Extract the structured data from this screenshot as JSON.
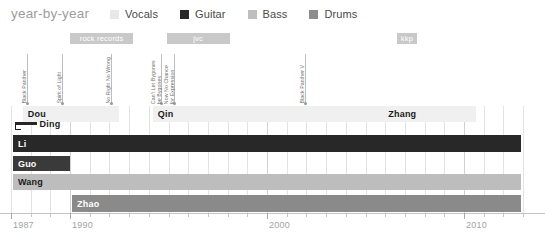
{
  "header": {
    "title": "year-by-year"
  },
  "legend": {
    "items": [
      {
        "label": "Vocals",
        "color": "#e8e8e8"
      },
      {
        "label": "Guitar",
        "color": "#262626"
      },
      {
        "label": "Bass",
        "color": "#bfbfbf"
      },
      {
        "label": "Drums",
        "color": "#8c8c8c"
      }
    ]
  },
  "chart_data": {
    "type": "bar",
    "title": "year-by-year",
    "xlabel": "",
    "ylabel": "",
    "xlim": [
      1987,
      2013.5
    ],
    "grid": true,
    "legend_position": "top",
    "axis": {
      "ticks": [
        1987,
        1990,
        2000,
        2010
      ],
      "tick_labels": [
        "1987",
        "1990",
        "2000",
        "2010"
      ],
      "minor_tick_step": 1
    },
    "categories": [
      "Vocals",
      "Guitar",
      "Bass",
      "Drums"
    ],
    "series": [
      {
        "name": "Vocals",
        "color": "#f0f0f0",
        "segments": [
          {
            "label": "Dou",
            "start": 1987.6,
            "end": 1992.5
          },
          {
            "label": "Qin",
            "start": 1994.2,
            "end": 2005.9
          },
          {
            "label": "Zhang",
            "start": 2005.9,
            "end": 2010.6
          }
        ]
      },
      {
        "name": "Vocals-sub",
        "color": "#262626",
        "segments": [
          {
            "label": "Ding",
            "start": 1987.2,
            "end": 1988.3
          }
        ]
      },
      {
        "name": "Guitar",
        "color": "#282828",
        "segments": [
          {
            "label": "Li",
            "start": 1987.1,
            "end": 2012.9
          }
        ]
      },
      {
        "name": "Guitar-sub",
        "color": "#3a3a3a",
        "segments": [
          {
            "label": "Guo",
            "start": 1987.1,
            "end": 1990.0
          }
        ]
      },
      {
        "name": "Bass",
        "color": "#bdbdbd",
        "segments": [
          {
            "label": "Wang",
            "start": 1987.1,
            "end": 2012.9
          }
        ]
      },
      {
        "name": "Drums",
        "color": "#8a8a8a",
        "segments": [
          {
            "label": "Zhao",
            "start": 1990.1,
            "end": 2012.9
          }
        ]
      }
    ],
    "label_bands": [
      {
        "label": "rock records",
        "start": 1990.0,
        "end": 1993.2
      },
      {
        "label": "jvc",
        "start": 1994.9,
        "end": 1998.1
      },
      {
        "label": "kkp",
        "start": 2006.6,
        "end": 2007.6
      }
    ],
    "events": [
      {
        "label": "Black Panther",
        "year": 1987.8,
        "lines": 1
      },
      {
        "label": "Spirit of Light",
        "year": 1989.6,
        "lines": 1
      },
      {
        "label": "No Right No Wrong",
        "year": 1992.1,
        "lines": 1
      },
      {
        "label": "Can't Let Bygones be Bygones",
        "year": 1994.6,
        "lines": 2
      },
      {
        "label": "Now No Chance for Expression",
        "year": 1995.3,
        "lines": 2
      },
      {
        "label": "Black Panther V",
        "year": 2001.9,
        "lines": 1
      }
    ]
  }
}
